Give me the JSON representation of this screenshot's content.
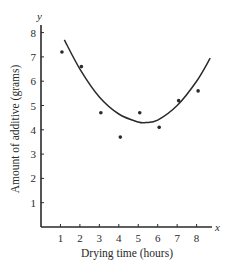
{
  "chart_data": {
    "type": "scatter",
    "title": "",
    "xlabel": "Drying time (hours)",
    "ylabel": "Amount of additive (grams)",
    "x_axis_var": "x",
    "y_axis_var": "y",
    "xlim": [
      0,
      8.8
    ],
    "ylim": [
      0,
      8.5
    ],
    "x_ticks": [
      1,
      2,
      3,
      4,
      5,
      6,
      7,
      8
    ],
    "y_ticks": [
      1,
      2,
      3,
      4,
      5,
      6,
      7,
      8
    ],
    "grid": false,
    "legend": null,
    "series": [
      {
        "name": "observations",
        "kind": "scatter",
        "x": [
          1,
          2,
          3,
          4,
          5,
          6,
          7,
          8
        ],
        "y": [
          7.2,
          6.6,
          4.7,
          3.7,
          4.7,
          4.1,
          5.2,
          5.6
        ]
      },
      {
        "name": "quadratic fit",
        "kind": "line",
        "x": [
          1.2,
          2,
          3,
          4,
          5,
          5.4,
          6,
          7,
          8,
          8.7
        ],
        "y": [
          7.7,
          6.5,
          5.35,
          4.65,
          4.32,
          4.3,
          4.4,
          5.0,
          6.0,
          6.95
        ]
      }
    ]
  },
  "colors": {
    "ink": "#2a2a2a",
    "background": "#ffffff"
  }
}
